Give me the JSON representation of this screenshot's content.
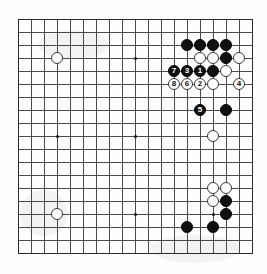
{
  "diagram": {
    "kind": "go-board-diagram",
    "board_size": 19,
    "visible_columns": 19,
    "visible_rows": 19,
    "grid": {
      "origin_x": 18,
      "origin_y": 19,
      "spacing": 13.0,
      "line_color": "#4a4a4a",
      "edge_color": "#2a2a2a",
      "background": "#fefefe"
    },
    "stone_radius": 6.2,
    "colors": {
      "black_stone": "#101010",
      "white_stone": "#fdfdfd",
      "black_label": "#ffffff",
      "white_label": "#101010"
    },
    "star_points": [
      {
        "col": 3,
        "row": 3
      },
      {
        "col": 9,
        "row": 3
      },
      {
        "col": 15,
        "row": 3
      },
      {
        "col": 3,
        "row": 9
      },
      {
        "col": 9,
        "row": 9
      },
      {
        "col": 15,
        "row": 9
      },
      {
        "col": 3,
        "row": 15
      },
      {
        "col": 9,
        "row": 15
      },
      {
        "col": 15,
        "row": 15
      }
    ],
    "stones": [
      {
        "col": 3,
        "row": 3,
        "color": "white",
        "label": ""
      },
      {
        "col": 3,
        "row": 15,
        "color": "white",
        "label": ""
      },
      {
        "col": 13,
        "row": 2,
        "color": "black",
        "label": ""
      },
      {
        "col": 14,
        "row": 2,
        "color": "black",
        "label": ""
      },
      {
        "col": 15,
        "row": 2,
        "color": "black",
        "label": ""
      },
      {
        "col": 16,
        "row": 2,
        "color": "black",
        "label": ""
      },
      {
        "col": 14,
        "row": 3,
        "color": "white",
        "label": ""
      },
      {
        "col": 15,
        "row": 3,
        "color": "white",
        "label": ""
      },
      {
        "col": 16,
        "row": 3,
        "color": "black",
        "label": ""
      },
      {
        "col": 17,
        "row": 3,
        "color": "white",
        "label": ""
      },
      {
        "col": 12,
        "row": 4,
        "color": "black",
        "label": "7"
      },
      {
        "col": 13,
        "row": 4,
        "color": "black",
        "label": "3"
      },
      {
        "col": 14,
        "row": 4,
        "color": "black",
        "label": "1"
      },
      {
        "col": 15,
        "row": 4,
        "color": "black",
        "label": ""
      },
      {
        "col": 16,
        "row": 4,
        "color": "white",
        "label": ""
      },
      {
        "col": 12,
        "row": 5,
        "color": "white",
        "label": "8"
      },
      {
        "col": 13,
        "row": 5,
        "color": "white",
        "label": "6"
      },
      {
        "col": 14,
        "row": 5,
        "color": "white",
        "label": "2"
      },
      {
        "col": 15,
        "row": 5,
        "color": "white",
        "label": ""
      },
      {
        "col": 17,
        "row": 5,
        "color": "white",
        "label": "4"
      },
      {
        "col": 14,
        "row": 7,
        "color": "black",
        "label": "5"
      },
      {
        "col": 16,
        "row": 7,
        "color": "black",
        "label": ""
      },
      {
        "col": 15,
        "row": 9,
        "color": "white",
        "label": ""
      },
      {
        "col": 15,
        "row": 13,
        "color": "white",
        "label": ""
      },
      {
        "col": 16,
        "row": 13,
        "color": "white",
        "label": ""
      },
      {
        "col": 15,
        "row": 14,
        "color": "white",
        "label": ""
      },
      {
        "col": 16,
        "row": 14,
        "color": "black",
        "label": ""
      },
      {
        "col": 16,
        "row": 15,
        "color": "black",
        "label": ""
      },
      {
        "col": 13,
        "row": 16,
        "color": "black",
        "label": ""
      },
      {
        "col": 15,
        "row": 16,
        "color": "black",
        "label": ""
      }
    ],
    "move_sequence": [
      {
        "number": "1",
        "color": "black"
      },
      {
        "number": "2",
        "color": "white"
      },
      {
        "number": "3",
        "color": "black"
      },
      {
        "number": "4",
        "color": "white"
      },
      {
        "number": "5",
        "color": "black"
      },
      {
        "number": "6",
        "color": "white"
      },
      {
        "number": "7",
        "color": "black"
      },
      {
        "number": "8",
        "color": "white"
      }
    ]
  }
}
